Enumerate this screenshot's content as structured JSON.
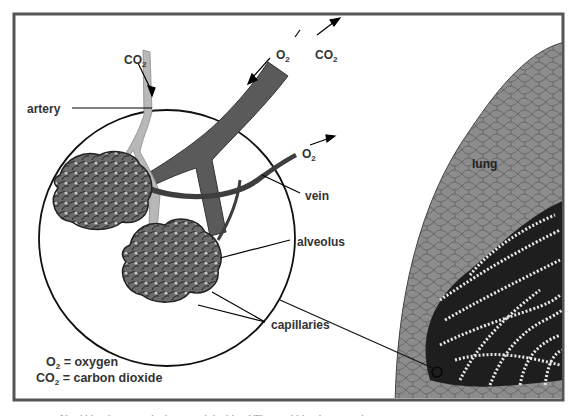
{
  "diagram": {
    "labels": {
      "co2_top_left": {
        "base": "CO",
        "sub": "2"
      },
      "o2_top": {
        "base": "O",
        "sub": "2"
      },
      "co2_top_right": {
        "base": "CO",
        "sub": "2"
      },
      "o2_vein": {
        "base": "O",
        "sub": "2"
      },
      "artery": "artery",
      "vein": "vein",
      "alveolus": "alveolus",
      "capillaries": "capillaries",
      "lung": "lung"
    },
    "legend": [
      {
        "symbol_base": "O",
        "symbol_sub": "2",
        "meaning": "= oxygen"
      },
      {
        "symbol_base": "CO",
        "symbol_sub": "2",
        "meaning": "= carbon dioxide"
      }
    ],
    "colors": {
      "frame": "#555555",
      "background": "#ffffff",
      "vessel_dark": "#555555",
      "artery_light": "#b5b5b5",
      "lung_gray": "#8a8a8a",
      "lung_inner_dark": "#1e1e1e",
      "label_text": "#333333"
    }
  },
  "caption": {
    "text": "Used  blood  oxygen  the  lungs  and  the  blood  The  used  blood  goes  to  the"
  }
}
